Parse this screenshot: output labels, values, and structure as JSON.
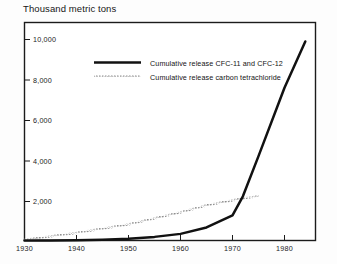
{
  "chart_data": {
    "type": "line",
    "title": "Thousand metric tons",
    "xlabel": "",
    "ylabel": "Thousand metric tons",
    "xlim": [
      1930,
      1986
    ],
    "ylim": [
      0,
      11000
    ],
    "xticks": [
      1930,
      1940,
      1950,
      1960,
      1970,
      1980
    ],
    "xtick_labels": [
      "1930",
      "1940",
      "1950",
      "1960",
      "1970",
      "1980"
    ],
    "yticks": [
      2000,
      4000,
      6000,
      8000,
      10000
    ],
    "ytick_labels": [
      "2,000",
      "4,000",
      "6,000",
      "8,000",
      "10,000"
    ],
    "grid": false,
    "legend_position": "upper-center",
    "series": [
      {
        "name": "Cumulative release CFC-11 and CFC-12",
        "style": "solid",
        "color": "#111111",
        "width": 2.4,
        "x": [
          1930,
          1935,
          1940,
          1945,
          1950,
          1955,
          1960,
          1965,
          1970,
          1972,
          1975,
          1980,
          1984
        ],
        "y": [
          0,
          5,
          15,
          40,
          90,
          180,
          330,
          650,
          1250,
          2200,
          4200,
          7600,
          9900
        ]
      },
      {
        "name": "Cumulative release carbon tetrachloride",
        "style": "dotted",
        "color": "#9a9a9a",
        "width": 1.6,
        "x": [
          1930,
          1940,
          1950,
          1960,
          1965,
          1970,
          1972,
          1975
        ],
        "y": [
          30,
          380,
          800,
          1400,
          1750,
          2000,
          2100,
          2200
        ]
      }
    ]
  },
  "title": {
    "text": "Thousand metric tons"
  },
  "axes": {
    "x_tick_labels": [
      "1930",
      "1940",
      "1950",
      "1960",
      "1970",
      "1980"
    ],
    "y_tick_labels": [
      "2,000",
      "4,000",
      "6,000",
      "8,000",
      "10,000"
    ]
  },
  "legend": {
    "entries": [
      {
        "label": "Cumulative release CFC-11 and CFC-12",
        "swatch": "solid-black-line"
      },
      {
        "label": "Cumulative release carbon tetrachloride",
        "swatch": "dotted-gray-line"
      }
    ]
  }
}
